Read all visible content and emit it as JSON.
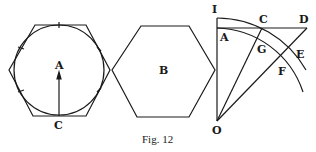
{
  "figure": {
    "caption": "Fig. 12",
    "ink_color": "#1a1a1a",
    "background": "#ffffff"
  },
  "left_figure": {
    "center_label": "A",
    "bottom_label": "C"
  },
  "middle_figure": {
    "center_label": "B"
  },
  "right_figure": {
    "labels": {
      "I": "I",
      "A": "A",
      "C": "C",
      "D": "D",
      "G": "G",
      "E": "E",
      "F": "F",
      "O": "O"
    }
  }
}
